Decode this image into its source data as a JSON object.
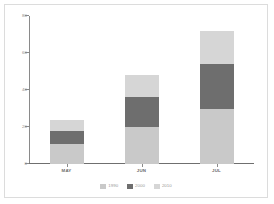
{
  "chart_data": {
    "type": "bar",
    "stacked": true,
    "title": "",
    "xlabel": "",
    "ylabel": "",
    "categories": [
      "MAY",
      "JUN",
      "JUL"
    ],
    "series": [
      {
        "name": "1990",
        "color": "#c9c9c9",
        "values": [
          11,
          20,
          30
        ]
      },
      {
        "name": "2000",
        "color": "#6e6e6e",
        "values": [
          7,
          16,
          24
        ]
      },
      {
        "name": "2010",
        "color": "#d6d6d6",
        "values": [
          6,
          12,
          18
        ]
      }
    ],
    "totals": [
      24,
      48,
      72
    ],
    "ylim": [
      0,
      80
    ],
    "yticks": [
      0,
      20,
      40,
      60,
      80
    ],
    "ytick_labels": [
      "0",
      "20",
      "40",
      "60",
      "80"
    ],
    "grid": false,
    "legend_position": "bottom-center"
  },
  "frame": {
    "border_color": "#dcdcdc",
    "background": "#ffffff"
  },
  "axis": {
    "line_color": "#8a8a8a",
    "tick_label_color": "#8c8c8c",
    "category_label_color": "#6b6b6b"
  }
}
